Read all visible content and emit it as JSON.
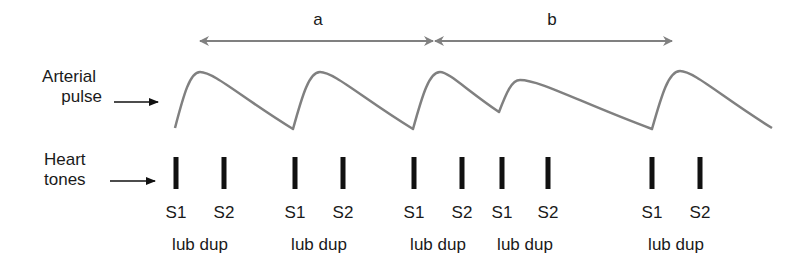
{
  "labels": {
    "arterial_pulse": [
      "Arterial",
      "pulse"
    ],
    "heart_tones": [
      "Heart",
      "tones"
    ]
  },
  "intervals": [
    {
      "label": "a",
      "x_start": 200,
      "x_end": 433,
      "label_x": 318
    },
    {
      "label": "b",
      "x_start": 435,
      "x_end": 672,
      "label_x": 552
    }
  ],
  "waveform": {
    "color": "#808080",
    "points": [
      [
        175,
        128
      ],
      [
        200,
        72
      ],
      [
        293,
        129
      ],
      [
        320,
        72
      ],
      [
        413,
        129
      ],
      [
        440,
        72
      ],
      [
        499,
        112
      ],
      [
        520,
        80
      ],
      [
        652,
        129
      ],
      [
        680,
        71
      ],
      [
        772,
        128
      ]
    ]
  },
  "heart_tones": [
    {
      "s1_x": 176,
      "s2_x": 224,
      "s1": "S1",
      "s2": "S2",
      "sound": "lub dup"
    },
    {
      "s1_x": 295,
      "s2_x": 343,
      "s1": "S1",
      "s2": "S2",
      "sound": "lub dup"
    },
    {
      "s1_x": 414,
      "s2_x": 462,
      "s1": "S1",
      "s2": "S2",
      "sound": "lub dup"
    },
    {
      "s1_x": 502,
      "s2_x": 548,
      "s1": "S1",
      "s2": "S2",
      "sound": "lub dup"
    },
    {
      "s1_x": 652,
      "s2_x": 700,
      "s1": "S1",
      "s2": "S2",
      "sound": "lub dup"
    }
  ]
}
